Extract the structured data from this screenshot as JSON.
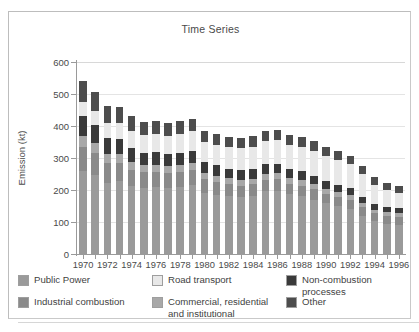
{
  "panel": {
    "title": "Time Series"
  },
  "axes": {
    "ylabel": "Emission (kt)",
    "yticks": [
      0,
      100,
      200,
      300,
      400,
      500,
      600
    ],
    "xlabels": [
      "1970",
      "1972",
      "1974",
      "1976",
      "1978",
      "1980",
      "1982",
      "1984",
      "1986",
      "1988",
      "1990",
      "1992",
      "1994",
      "1996"
    ]
  },
  "legend": {
    "items": [
      {
        "label": "Public Power",
        "color": "#9a9a9a"
      },
      {
        "label": "Road transport",
        "color": "#e8e8e8"
      },
      {
        "label": "Non-combustion processes",
        "color": "#3a3a3a"
      },
      {
        "label": "Industrial combustion",
        "color": "#8a8a8a"
      },
      {
        "label": "Commercial, residential\nand institutional",
        "color": "#a8a8a8"
      },
      {
        "label": "Other",
        "color": "#4d4d4d"
      }
    ]
  },
  "chart_data": {
    "type": "bar",
    "stacked": true,
    "title": "Time Series",
    "xlabel": "",
    "ylabel": "Emission (kt)",
    "ylim": [
      0,
      600
    ],
    "ytick_step": 100,
    "grid": true,
    "legend_position": "bottom",
    "categories": [
      "1970",
      "1971",
      "1972",
      "1973",
      "1974",
      "1975",
      "1976",
      "1977",
      "1978",
      "1979",
      "1980",
      "1981",
      "1982",
      "1983",
      "1984",
      "1985",
      "1986",
      "1987",
      "1988",
      "1989",
      "1990",
      "1991",
      "1992",
      "1993",
      "1994",
      "1995",
      "1996"
    ],
    "series": [
      {
        "name": "Public Power",
        "color": "#9a9a9a",
        "values": [
          258,
          248,
          222,
          228,
          212,
          205,
          208,
          206,
          210,
          215,
          192,
          185,
          180,
          178,
          182,
          196,
          198,
          186,
          180,
          170,
          158,
          150,
          142,
          120,
          102,
          95,
          92
        ]
      },
      {
        "name": "Industrial combustion",
        "color": "#8a8a8a",
        "values": [
          78,
          68,
          62,
          58,
          52,
          50,
          48,
          46,
          46,
          46,
          42,
          40,
          38,
          36,
          36,
          36,
          36,
          34,
          34,
          32,
          30,
          29,
          28,
          26,
          25,
          24,
          24
        ]
      },
      {
        "name": "Commercial, residential and institutional",
        "color": "#a8a8a8",
        "values": [
          34,
          30,
          28,
          26,
          24,
          22,
          22,
          22,
          22,
          22,
          20,
          20,
          19,
          18,
          18,
          18,
          18,
          17,
          17,
          16,
          15,
          15,
          14,
          13,
          12,
          12,
          12
        ]
      },
      {
        "name": "Non-combustion processes",
        "color": "#3a3a3a",
        "values": [
          62,
          56,
          50,
          48,
          44,
          40,
          40,
          38,
          38,
          38,
          34,
          32,
          30,
          30,
          30,
          30,
          30,
          28,
          28,
          26,
          24,
          23,
          22,
          20,
          18,
          17,
          16
        ]
      },
      {
        "name": "Road transport",
        "color": "#e8e8e8",
        "values": [
          44,
          46,
          48,
          50,
          52,
          54,
          56,
          58,
          60,
          62,
          62,
          64,
          66,
          68,
          70,
          72,
          74,
          76,
          76,
          78,
          78,
          76,
          74,
          70,
          60,
          52,
          48
        ]
      },
      {
        "name": "Other",
        "color": "#4d4d4d",
        "values": [
          64,
          58,
          52,
          50,
          46,
          42,
          42,
          40,
          40,
          40,
          36,
          34,
          33,
          32,
          32,
          32,
          32,
          31,
          31,
          30,
          29,
          28,
          27,
          25,
          23,
          22,
          22
        ]
      }
    ],
    "totals": [
      540,
      506,
      462,
      460,
      430,
      413,
      416,
      410,
      416,
      423,
      386,
      375,
      366,
      362,
      368,
      384,
      388,
      372,
      366,
      352,
      334,
      321,
      307,
      274,
      240,
      222,
      214
    ]
  }
}
